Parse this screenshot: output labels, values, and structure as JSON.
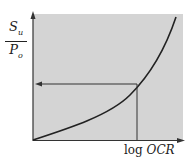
{
  "diagram": {
    "y_label": {
      "numerator": "S",
      "numerator_sub": "u",
      "denominator": "P",
      "denominator_sub": "o"
    },
    "x_label": {
      "prefix": "log",
      "variable": "OCR"
    },
    "colors": {
      "plot_background": "#d4d4d4",
      "line": "#222222"
    }
  }
}
